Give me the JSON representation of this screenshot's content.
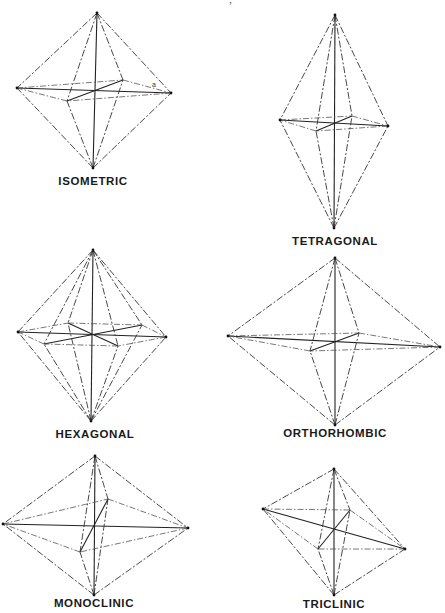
{
  "page_fragment": "‘ ’ ,",
  "crystal_systems": [
    {
      "name": "ISOMETRIC",
      "label_pos": [
        93,
        182
      ],
      "axis_label": "a",
      "axis_label_pos": [
        152,
        87
      ],
      "vertices": {
        "top": [
          97,
          13
        ],
        "bottom": [
          93,
          168
        ],
        "left": [
          17,
          88
        ],
        "right": [
          171,
          93
        ],
        "back": [
          123,
          80
        ],
        "front": [
          67,
          101
        ],
        "center": [
          95,
          90
        ]
      }
    },
    {
      "name": "TETRAGONAL",
      "label_pos": [
        335,
        242
      ],
      "vertices": {
        "top": [
          335,
          15
        ],
        "bottom": [
          334,
          228
        ],
        "left": [
          280,
          120
        ],
        "right": [
          388,
          126
        ],
        "back": [
          352,
          116
        ],
        "front": [
          316,
          131
        ],
        "center": [
          335,
          124
        ]
      }
    },
    {
      "name": "HEXAGONAL",
      "label_pos": [
        95,
        435
      ],
      "vertices": {
        "top": [
          93,
          250
        ],
        "bottom": [
          91,
          421
        ],
        "left": [
          18,
          332
        ],
        "right": [
          166,
          337
        ],
        "inner_back_left": [
          68,
          323
        ],
        "inner_back_right": [
          142,
          325
        ],
        "inner_front_left": [
          44,
          344
        ],
        "inner_front_right": [
          118,
          346
        ],
        "center": [
          92,
          335
        ]
      }
    },
    {
      "name": "ORTHORHOMBIC",
      "label_pos": [
        335,
        434
      ],
      "vertices": {
        "top": [
          335,
          258
        ],
        "bottom": [
          335,
          425
        ],
        "left": [
          228,
          336
        ],
        "right": [
          440,
          347
        ],
        "back": [
          359,
          333
        ],
        "front": [
          310,
          351
        ],
        "center": [
          335,
          342
        ]
      }
    },
    {
      "name": "MONOCLINIC",
      "label_pos": [
        94,
        604
      ],
      "vertices": {
        "top": [
          95,
          456
        ],
        "bottom": [
          94,
          595
        ],
        "left": [
          3,
          524
        ],
        "right": [
          188,
          528
        ],
        "back": [
          108,
          499
        ],
        "front": [
          80,
          552
        ],
        "center": [
          95,
          526
        ]
      }
    },
    {
      "name": "TRICLINIC",
      "label_pos": [
        334,
        605
      ],
      "vertices": {
        "top": [
          334,
          469
        ],
        "bottom": [
          334,
          595
        ],
        "left": [
          263,
          509
        ],
        "right": [
          405,
          549
        ],
        "back": [
          350,
          510
        ],
        "front": [
          318,
          549
        ],
        "center": [
          334,
          530
        ]
      }
    }
  ]
}
